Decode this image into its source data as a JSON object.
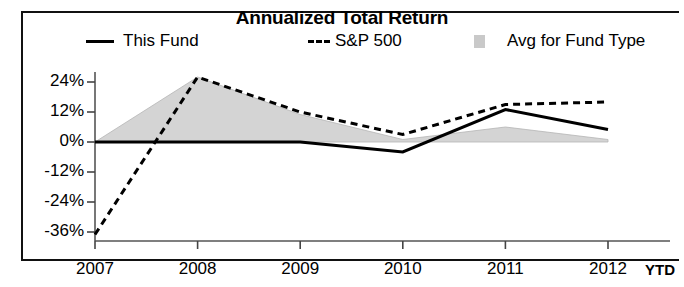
{
  "chart_data": {
    "type": "area",
    "title": "Annualized Total Return",
    "xlabel": "",
    "ylabel": "",
    "x": [
      "2007",
      "2008",
      "2009",
      "2010",
      "2011",
      "2012"
    ],
    "x_extra_label": "YTD",
    "ytick_labels": [
      "24%",
      "12%",
      "0%",
      "-12%",
      "-24%",
      "-36%"
    ],
    "ytick_values": [
      24,
      12,
      0,
      -12,
      -24,
      -36
    ],
    "ylim": [
      -37,
      30
    ],
    "grid": false,
    "legend_position": "top",
    "series": [
      {
        "name": "This Fund",
        "style": "solid-line",
        "color": "#000000",
        "values": [
          0,
          0,
          0,
          -4,
          13,
          5
        ]
      },
      {
        "name": "S&P 500",
        "style": "dashed-line",
        "color": "#000000",
        "values": [
          -37,
          26,
          12,
          3,
          15,
          16
        ]
      },
      {
        "name": "Avg for Fund Type",
        "style": "shaded-band",
        "color": "#d4d4d4",
        "values": [
          0,
          26,
          11,
          1,
          6,
          1
        ]
      }
    ],
    "legend": [
      {
        "label": "This Fund",
        "marker": "solid-line-swatch"
      },
      {
        "label": "S&P 500",
        "marker": "dashed-line-swatch"
      },
      {
        "label": "Avg for Fund Type",
        "marker": "gray-square-swatch"
      }
    ]
  }
}
